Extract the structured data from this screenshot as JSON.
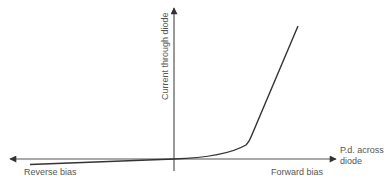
{
  "diagram": {
    "labels": {
      "y_axis": "Current through diode",
      "x_axis": "P.d. across diode",
      "x_axis_line1": "P.d. across",
      "x_axis_line2": "diode",
      "reverse": "Reverse bias",
      "forward": "Forward bias"
    },
    "colors": {
      "axis": "#555555",
      "curve": "#333333",
      "text": "#555555",
      "background": "#ffffff"
    }
  }
}
